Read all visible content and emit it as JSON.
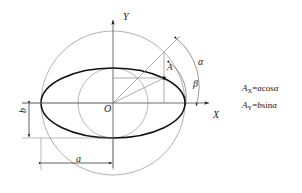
{
  "figure": {
    "kind": "ellipse-parametric-construction-diagram",
    "axes": {
      "x_label": "X",
      "y_label": "Y",
      "origin_label": "O"
    },
    "points": {
      "A": "A"
    },
    "angles": {
      "alpha": "α",
      "beta": "β"
    },
    "dimensions": {
      "semi_major_label": "a",
      "semi_minor_label": "b"
    },
    "equations": [
      {
        "lhs": "A",
        "sub": "X",
        "eq": "=",
        "rhs_a": "a",
        "rhs_fn": "cos",
        "rhs_arg": "α"
      },
      {
        "lhs": "A",
        "sub": "Y",
        "eq": "=",
        "rhs_a": "b",
        "rhs_fn": "sin",
        "rhs_arg": "α"
      }
    ],
    "colors": {
      "ink": "#1a1a1a",
      "thin": "#8a8a8a",
      "ellipse": "#111111",
      "background": "#ffffff"
    }
  }
}
